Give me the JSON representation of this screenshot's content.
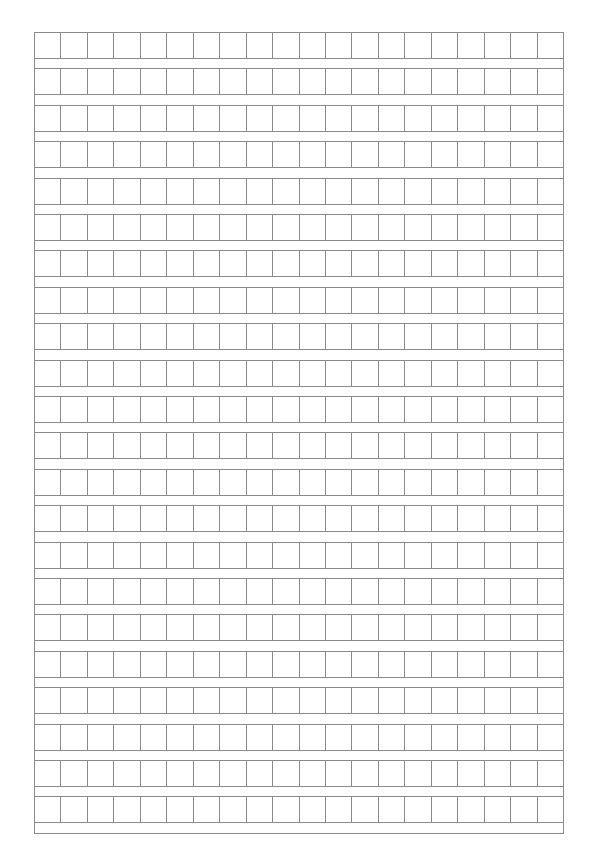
{
  "paper": {
    "type": "composition-grid-paper",
    "rows": 22,
    "columns": 20,
    "line_color": "#8a8a8a",
    "background": "#ffffff",
    "row_pitch_px": 36.4,
    "cell_height_px": 27
  }
}
